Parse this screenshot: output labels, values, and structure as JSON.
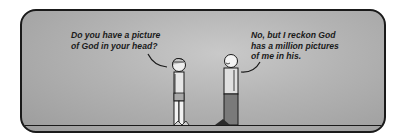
{
  "comic": {
    "panel": {
      "background_color": "#b3b3b3",
      "border_color": "#1a1a1a"
    },
    "speech": [
      {
        "speaker": "left-figure",
        "text": "Do you have a picture\nof God in your head?"
      },
      {
        "speaker": "right-figure",
        "text": "No, but I reckon God\nhas a million pictures\nof me in his."
      }
    ],
    "characters": [
      {
        "name": "child",
        "position": "left",
        "facing": "right"
      },
      {
        "name": "adult",
        "position": "right",
        "facing": "left"
      }
    ]
  }
}
